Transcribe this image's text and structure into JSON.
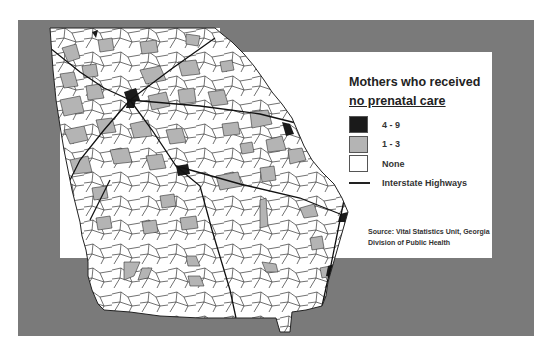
{
  "legend": {
    "title_line1": "Mothers who received",
    "title_line2": "no prenatal care",
    "items": [
      {
        "label": "4 - 9",
        "color": "#1a1a1a",
        "type": "box"
      },
      {
        "label": "1 - 3",
        "color": "#b4b4b4",
        "type": "box"
      },
      {
        "label": "None",
        "color": "#ffffff",
        "type": "box"
      },
      {
        "label": "Interstate Highways",
        "color": "#222222",
        "type": "line"
      }
    ]
  },
  "source": {
    "line1": "Source: Vital Statistics Unit, Georgia",
    "line2": "Division of Public Health"
  },
  "colors": {
    "frame": "#7a7a7a",
    "panel": "#ffffff",
    "none": "#ffffff",
    "low": "#b4b4b4",
    "high": "#1a1a1a"
  }
}
